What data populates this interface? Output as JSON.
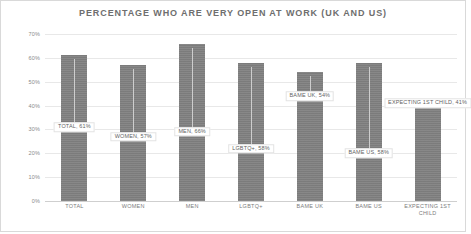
{
  "chart": {
    "title": "PERCENTAGE WHO ARE VERY OPEN AT WORK (UK AND US)"
  },
  "chart_data": {
    "type": "bar",
    "title": "PERCENTAGE WHO ARE VERY OPEN AT WORK (UK AND US)",
    "xlabel": "",
    "ylabel": "",
    "ylim": [
      0,
      70
    ],
    "grid": true,
    "legend": false,
    "bar_color": "#818181",
    "categories": [
      "TOTAL",
      "WOMEN",
      "MEN",
      "LGBTQ+",
      "BAME UK",
      "BAME US",
      "EXPECTING 1ST CHILD"
    ],
    "values": [
      61,
      57,
      66,
      58,
      54,
      58,
      41
    ],
    "yticks": [
      "0%",
      "10%",
      "20%",
      "30%",
      "40%",
      "50%",
      "60%",
      "70%"
    ],
    "ytick_values": [
      0,
      10,
      20,
      30,
      40,
      50,
      60,
      70
    ],
    "data_labels": [
      {
        "text": "TOTAL, 61%",
        "value": 61,
        "label_y": 31
      },
      {
        "text": "WOMEN, 57%",
        "value": 57,
        "label_y": 27
      },
      {
        "text": "MEN, 66%",
        "value": 66,
        "label_y": 29
      },
      {
        "text": "LGBTQ+, 58%",
        "value": 58,
        "label_y": 22
      },
      {
        "text": "BAME UK, 54%",
        "value": 54,
        "label_y": 44
      },
      {
        "text": "BAME US, 58%",
        "value": 58,
        "label_y": 20
      },
      {
        "text": "EXPECTING 1ST CHILD, 41%",
        "value": 41,
        "label_y": 41
      }
    ],
    "xtick_labels": [
      {
        "line1": "TOTAL",
        "line2": ""
      },
      {
        "line1": "WOMEN",
        "line2": ""
      },
      {
        "line1": "MEN",
        "line2": ""
      },
      {
        "line1": "LGBTQ+",
        "line2": ""
      },
      {
        "line1": "BAME UK",
        "line2": ""
      },
      {
        "line1": "BAME US",
        "line2": ""
      },
      {
        "line1": "EXPECTING 1ST",
        "line2": "CHILD"
      }
    ]
  }
}
